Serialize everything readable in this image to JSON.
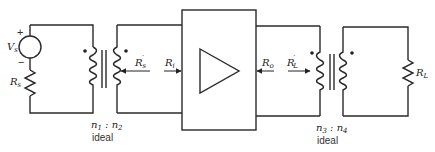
{
  "diagram": {
    "type": "circuit-schematic",
    "source": {
      "voltage_label": "V",
      "voltage_sub": "s",
      "plus_sign": "+",
      "minus_sign": "−",
      "resistor_label": "R",
      "resistor_sub": "s"
    },
    "input_transformer": {
      "ratio_n1": "n",
      "ratio_n1_sub": "1",
      "ratio_sep": " : ",
      "ratio_n2": "n",
      "ratio_n2_sub": "2",
      "note": "ideal"
    },
    "arrows": {
      "rs_prime": {
        "label": "R",
        "sub": "s",
        "prime": "′"
      },
      "ri": {
        "label": "R",
        "sub": "i"
      },
      "ro": {
        "label": "R",
        "sub": "o"
      },
      "rl_prime": {
        "label": "R",
        "sub": "L",
        "prime": "′"
      }
    },
    "amplifier": {
      "symbol": "triangle"
    },
    "output_transformer": {
      "ratio_n3": "n",
      "ratio_n3_sub": "3",
      "ratio_sep": " : ",
      "ratio_n4": "n",
      "ratio_n4_sub": "4",
      "note": "ideal"
    },
    "load": {
      "resistor_label": "R",
      "resistor_sub": "L"
    }
  }
}
